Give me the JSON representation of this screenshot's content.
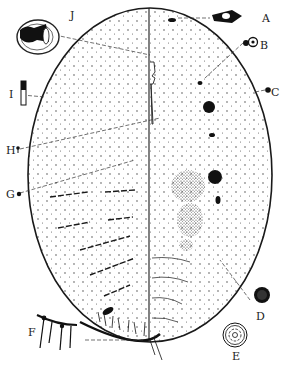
{
  "figure": {
    "colors": {
      "ink": "#1a1a1a",
      "background": "#ffffff"
    },
    "labels": [
      {
        "id": "A",
        "text": "A",
        "x": 262,
        "y": 13
      },
      {
        "id": "B",
        "text": "B",
        "x": 260,
        "y": 40
      },
      {
        "id": "C",
        "text": "C",
        "x": 271,
        "y": 87
      },
      {
        "id": "D",
        "text": "D",
        "x": 256,
        "y": 311
      },
      {
        "id": "E",
        "text": "E",
        "x": 237,
        "y": 351
      },
      {
        "id": "F",
        "text": "F",
        "x": 28,
        "y": 327
      },
      {
        "id": "G",
        "text": "G",
        "x": 6,
        "y": 189
      },
      {
        "id": "H",
        "text": "H",
        "x": 6,
        "y": 145
      },
      {
        "id": "I",
        "text": "I",
        "x": 9,
        "y": 89
      },
      {
        "id": "J",
        "text": "J",
        "x": 70,
        "y": 10
      }
    ]
  }
}
